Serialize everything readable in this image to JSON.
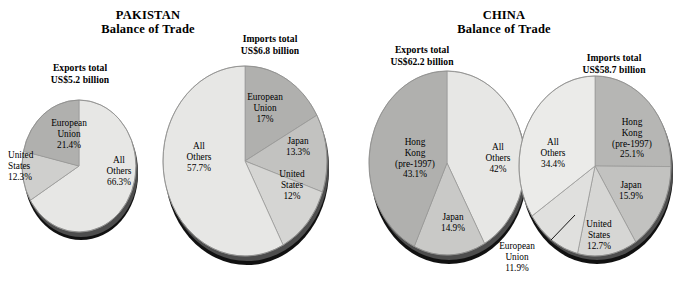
{
  "colors": {
    "all_others": "#e7e7e5",
    "mid_light": "#d2d2d0",
    "mid": "#c2c2c0",
    "dark": "#b0b0ae",
    "edge": "#7a7a78",
    "shadow": "#1a1a1a"
  },
  "panels": [
    {
      "id": "pakistan",
      "title_line1": "PAKISTAN",
      "title_line2": "Balance of Trade",
      "charts": [
        {
          "id": "pakistan-exports",
          "total_line1": "Exports total",
          "total_line2": "US$5.2 billion",
          "slices": [
            {
              "label_line1": "All",
              "label_line2": "Others",
              "label_line3": "66.3%",
              "value": 66.3,
              "fill": "#e7e7e5"
            },
            {
              "label_line1": "United",
              "label_line2": "States",
              "label_line3": "12.3%",
              "value": 12.3,
              "fill": "#d2d2d0"
            },
            {
              "label_line1": "European",
              "label_line2": "Union",
              "label_line3": "21.4%",
              "value": 21.4,
              "fill": "#b0b0ae"
            }
          ]
        },
        {
          "id": "pakistan-imports",
          "total_line1": "Imports total",
          "total_line2": "US$6.8 billion",
          "slices": [
            {
              "label_line1": "European",
              "label_line2": "Union",
              "label_line3": "17%",
              "value": 17.0,
              "fill": "#b0b0ae"
            },
            {
              "label_line1": "Japan",
              "label_line2": "13.3%",
              "label_line3": "",
              "value": 13.3,
              "fill": "#c2c2c0"
            },
            {
              "label_line1": "United",
              "label_line2": "States",
              "label_line3": "12%",
              "value": 12.0,
              "fill": "#d2d2d0"
            },
            {
              "label_line1": "All",
              "label_line2": "Others",
              "label_line3": "57.7%",
              "value": 57.7,
              "fill": "#e7e7e5"
            }
          ]
        }
      ]
    },
    {
      "id": "china",
      "title_line1": "CHINA",
      "title_line2": "Balance of Trade",
      "charts": [
        {
          "id": "china-exports",
          "total_line1": "Exports total",
          "total_line2": "US$62.2 billion",
          "slices": [
            {
              "label_line1": "All",
              "label_line2": "Others",
              "label_line3": "42%",
              "value": 42.0,
              "fill": "#e7e7e5"
            },
            {
              "label_line1": "Japan",
              "label_line2": "14.9%",
              "label_line3": "",
              "value": 14.9,
              "fill": "#c9c9c7"
            },
            {
              "label_line1": "Hong",
              "label_line2": "Kong",
              "label_line3": "(pre-1997)",
              "label_line4": "43.1%",
              "value": 43.1,
              "fill": "#b0b0ae"
            }
          ]
        },
        {
          "id": "china-imports",
          "total_line1": "Imports total",
          "total_line2": "US$58.7 billion",
          "slices": [
            {
              "label_line1": "Hong",
              "label_line2": "Kong",
              "label_line3": "(pre-1997)",
              "label_line4": "25.1%",
              "value": 25.1,
              "fill": "#b6b6b4"
            },
            {
              "label_line1": "Japan",
              "label_line2": "15.9%",
              "label_line3": "",
              "value": 15.9,
              "fill": "#c2c2c0"
            },
            {
              "label_line1": "United",
              "label_line2": "States",
              "label_line3": "12.7%",
              "value": 12.7,
              "fill": "#d6d6d4"
            },
            {
              "label_line1": "European",
              "label_line2": "Union",
              "label_line3": "11.9%",
              "value": 11.9,
              "fill": "#e0e0de"
            },
            {
              "label_line1": "All",
              "label_line2": "Others",
              "label_line3": "34.4%",
              "value": 34.4,
              "fill": "#ebebe9"
            }
          ]
        }
      ]
    }
  ],
  "chart_data": [
    {
      "type": "pie",
      "title": "PAKISTAN Balance of Trade — Exports total US$5.2 billion",
      "categories": [
        "All Others",
        "United States",
        "European Union"
      ],
      "values": [
        66.3,
        12.3,
        21.4
      ],
      "unit": "%",
      "total": "US$5.2 billion",
      "legend": "in-slice labels",
      "notes": "3-D pie, starts at 12 o'clock clockwise"
    },
    {
      "type": "pie",
      "title": "PAKISTAN Balance of Trade — Imports total US$6.8 billion",
      "categories": [
        "European Union",
        "Japan",
        "United States",
        "All Others"
      ],
      "values": [
        17.0,
        13.3,
        12.0,
        57.7
      ],
      "unit": "%",
      "total": "US$6.8 billion",
      "legend": "in-slice labels",
      "notes": "3-D pie, starts at 12 o'clock clockwise"
    },
    {
      "type": "pie",
      "title": "CHINA Balance of Trade — Exports total US$62.2 billion",
      "categories": [
        "All Others",
        "Japan",
        "Hong Kong (pre-1997)"
      ],
      "values": [
        42.0,
        14.9,
        43.1
      ],
      "unit": "%",
      "total": "US$62.2 billion",
      "legend": "in-slice labels",
      "notes": "3-D pie, starts at 12 o'clock clockwise"
    },
    {
      "type": "pie",
      "title": "CHINA Balance of Trade — Imports total US$58.7 billion",
      "categories": [
        "Hong Kong (pre-1997)",
        "Japan",
        "United States",
        "European Union",
        "All Others"
      ],
      "values": [
        25.1,
        15.9,
        12.7,
        11.9,
        34.4
      ],
      "unit": "%",
      "total": "US$58.7 billion",
      "legend": "in-slice labels; European Union uses a leader line to an outside label",
      "notes": "3-D pie, starts at 12 o'clock clockwise"
    }
  ]
}
